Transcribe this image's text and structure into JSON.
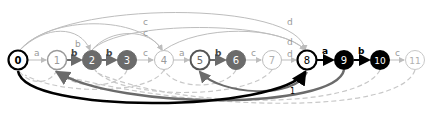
{
  "diagram": {
    "type": "automaton",
    "nodes": [
      {
        "id": "0",
        "label": "0",
        "x": 18,
        "y": 60,
        "style": "start"
      },
      {
        "id": "1",
        "label": "1",
        "x": 57,
        "y": 60,
        "style": "light"
      },
      {
        "id": "2",
        "label": "2",
        "x": 92,
        "y": 60,
        "style": "gray"
      },
      {
        "id": "3",
        "label": "3",
        "x": 127,
        "y": 60,
        "style": "gray"
      },
      {
        "id": "4",
        "label": "4",
        "x": 164,
        "y": 60,
        "style": "light"
      },
      {
        "id": "5",
        "label": "5",
        "x": 200,
        "y": 60,
        "style": "gray-ring"
      },
      {
        "id": "6",
        "label": "6",
        "x": 236,
        "y": 60,
        "style": "gray"
      },
      {
        "id": "7",
        "label": "7",
        "x": 272,
        "y": 60,
        "style": "light"
      },
      {
        "id": "8",
        "label": "8",
        "x": 307,
        "y": 60,
        "style": "black-ring"
      },
      {
        "id": "9",
        "label": "9",
        "x": 344,
        "y": 60,
        "style": "black"
      },
      {
        "id": "10",
        "label": "10",
        "x": 380,
        "y": 60,
        "style": "black"
      },
      {
        "id": "11",
        "label": "11",
        "x": 415,
        "y": 60,
        "style": "light"
      }
    ],
    "edges": [
      {
        "from": "0",
        "to": "1",
        "label": "a"
      },
      {
        "from": "1",
        "to": "2",
        "label": "b"
      },
      {
        "from": "2",
        "to": "3",
        "label": "b"
      },
      {
        "from": "3",
        "to": "4",
        "label": "c"
      },
      {
        "from": "4",
        "to": "5",
        "label": "a"
      },
      {
        "from": "5",
        "to": "6",
        "label": "b"
      },
      {
        "from": "6",
        "to": "7",
        "label": "c"
      },
      {
        "from": "7",
        "to": "8",
        "label": "d"
      },
      {
        "from": "8",
        "to": "9",
        "label": "a",
        "weight": "1"
      },
      {
        "from": "9",
        "to": "10",
        "label": "b",
        "weight": "2"
      },
      {
        "from": "10",
        "to": "11",
        "label": "c"
      },
      {
        "from": "0",
        "to": "2",
        "label": "b",
        "arc": "top"
      },
      {
        "from": "0",
        "to": "4",
        "label": "c",
        "arc": "top"
      },
      {
        "from": "0",
        "to": "4",
        "label": "c",
        "arc": "top"
      },
      {
        "from": "0",
        "to": "8",
        "label": "d",
        "arc": "top"
      },
      {
        "from": "2",
        "to": "8",
        "label": "d",
        "arc": "top"
      },
      {
        "from": "4",
        "to": "8",
        "label": "d",
        "arc": "top"
      },
      {
        "from": "8",
        "to": "0",
        "label": "1",
        "arc": "bottom"
      }
    ],
    "colors": {
      "black": "#000000",
      "gray": "#6b6b6b",
      "light": "#bdbdbd",
      "dashed": "#c8c8c8",
      "background": "#ffffff"
    }
  }
}
